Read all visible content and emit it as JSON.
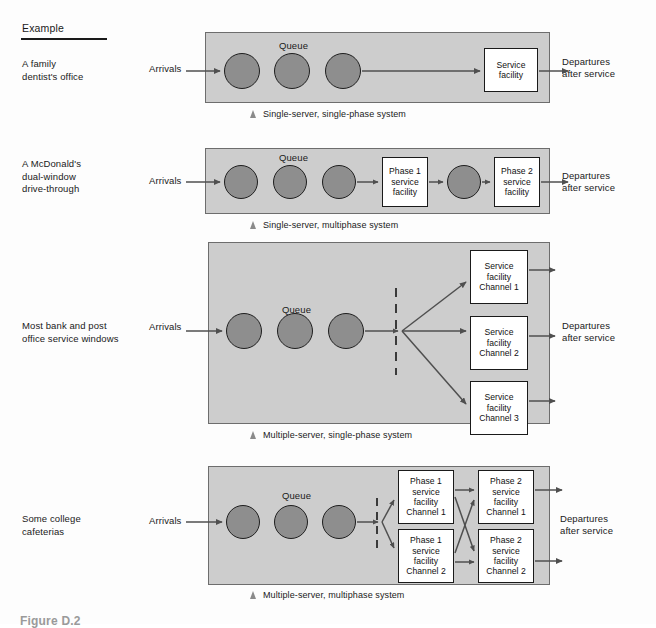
{
  "header": {
    "example_column_title": "Example"
  },
  "examples": [
    {
      "label": "A family\ndentist's office"
    },
    {
      "label": "A McDonald's\ndual-window\ndrive-through"
    },
    {
      "label": "Most bank and post\noffice service windows"
    },
    {
      "label": "Some college\ncafeterias"
    }
  ],
  "common": {
    "arrivals": "Arrivals",
    "queue": "Queue",
    "departures": "Departures\nafter service"
  },
  "systems": [
    {
      "id": "single-server-single-phase",
      "caption": "Single-server, single-phase system",
      "queue_circles": 3,
      "service_boxes": [
        {
          "name": "service-facility",
          "text": "Service\nfacility"
        }
      ]
    },
    {
      "id": "single-server-multiphase",
      "caption": "Single-server, multiphase system",
      "queue_circles": 3,
      "inline_circles": 1,
      "service_boxes": [
        {
          "name": "phase-1-service-facility",
          "text": "Phase 1\nservice\nfacility"
        },
        {
          "name": "phase-2-service-facility",
          "text": "Phase 2\nservice\nfacility"
        }
      ]
    },
    {
      "id": "multiple-server-single-phase",
      "caption": "Multiple-server, single-phase system",
      "queue_circles": 3,
      "service_boxes": [
        {
          "name": "service-facility-channel-1",
          "text": "Service\nfacility\nChannel 1"
        },
        {
          "name": "service-facility-channel-2",
          "text": "Service\nfacility\nChannel 2"
        },
        {
          "name": "service-facility-channel-3",
          "text": "Service\nfacility\nChannel 3"
        }
      ]
    },
    {
      "id": "multiple-server-multiphase",
      "caption": "Multiple-server, multiphase system",
      "queue_circles": 3,
      "service_boxes": [
        {
          "name": "phase-1-service-facility-channel-1",
          "text": "Phase 1\nservice\nfacility\nChannel 1"
        },
        {
          "name": "phase-1-service-facility-channel-2",
          "text": "Phase 1\nservice\nfacility\nChannel 2"
        },
        {
          "name": "phase-2-service-facility-channel-1",
          "text": "Phase 2\nservice\nfacility\nChannel 1"
        },
        {
          "name": "phase-2-service-facility-channel-2",
          "text": "Phase 2\nservice\nfacility\nChannel 2"
        }
      ]
    }
  ],
  "figure_caption": "Figure D.2",
  "colors": {
    "panel_fill": "#cdcdcd",
    "circle_fill": "#8e8e8e",
    "box_fill": "#ffffff",
    "stroke": "#1a1a1a",
    "arrow": "#555555"
  }
}
